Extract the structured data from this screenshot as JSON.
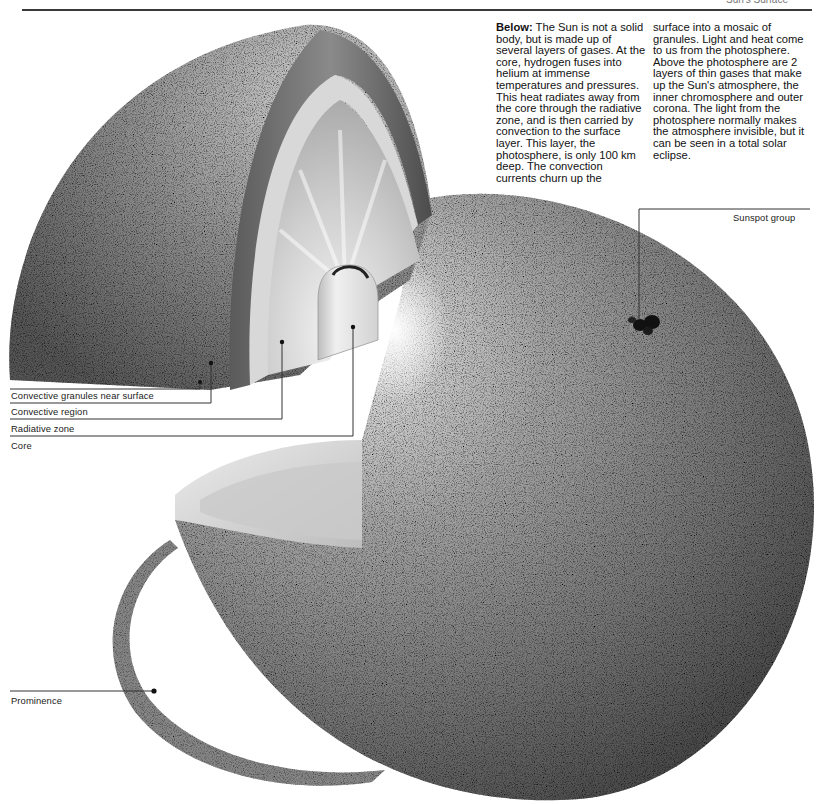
{
  "page": {
    "header_partial_text": "Sun's Surface"
  },
  "caption": {
    "lead": "Below:",
    "column1": "The Sun is not a solid body, but is made up of several layers of gases. At the core, hydrogen fuses into helium at immense temperatures and pressures. This heat radiates away from the core through the radiative zone, and is then carried by convection to the surface layer. This layer, the photosphere, is only 100 km deep. The convection currents churn up the",
    "column2": "surface into a mosaic of granules. Light and heat come to us from the photosphere. Above the photosphere are 2 layers of thin gases that make up the Sun's atmosphere, the inner chromosphere and outer corona. The light from the photosphere normally makes the atmosphere invisible, but it can be seen in a total solar eclipse."
  },
  "labels": {
    "convective_granules": "Convective granules near surface",
    "convective_region": "Convective region",
    "radiative_zone": "Radiative zone",
    "core": "Core",
    "sunspot_group": "Sunspot group",
    "prominence": "Prominence"
  },
  "colors": {
    "sphere_light": "#d6d6d6",
    "sphere_mid": "#8a8a8a",
    "sphere_dark": "#4a4a4a",
    "leader_line": "#333333"
  }
}
